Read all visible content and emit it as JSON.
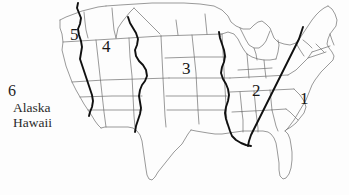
{
  "figure": {
    "type": "map",
    "background_color": "#fdfdfd",
    "outline_color": "#6b6b6b",
    "boundary_color": "#111111",
    "label_color": "#171717"
  },
  "legend": {
    "number": "6",
    "lines": [
      "Alaska",
      "Hawaii"
    ]
  },
  "regions": [
    {
      "id": "1",
      "label": "1",
      "x": 303,
      "y": 96,
      "name": "region-1-southeast"
    },
    {
      "id": "2",
      "label": "2",
      "x": 255,
      "y": 88,
      "name": "region-2-south-central"
    },
    {
      "id": "3",
      "label": "3",
      "x": 185,
      "y": 66,
      "name": "region-3-central"
    },
    {
      "id": "4",
      "label": "4",
      "x": 104,
      "y": 44,
      "name": "region-4-mountain"
    },
    {
      "id": "5",
      "label": "5",
      "x": 72,
      "y": 33,
      "name": "region-5-pacific"
    }
  ]
}
